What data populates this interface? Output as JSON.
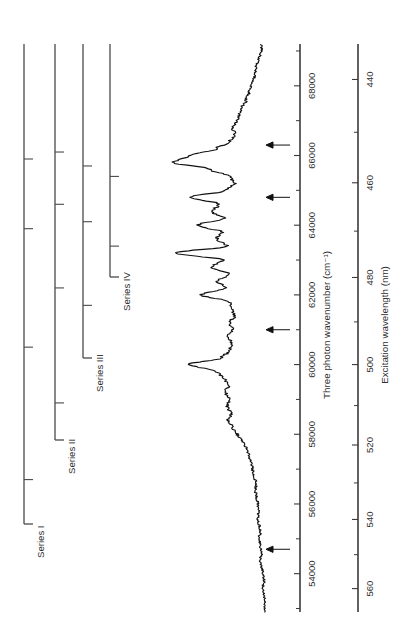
{
  "figure": {
    "orientation": "rotated-90-ccw",
    "background_color": "#ffffff",
    "trace_color": "#111111",
    "axis_color": "#3a3a3a",
    "series_bracket_color": "#4a4a4a"
  },
  "axes": {
    "wavenumber": {
      "label": "Three photon wavenumber (cm⁻¹)",
      "unit": "cm-1",
      "ticks": [
        54000,
        56000,
        58000,
        60000,
        62000,
        64000,
        66000,
        68000
      ],
      "tick_labels": [
        "54000",
        "56000",
        "58000",
        "60000",
        "62000",
        "64000",
        "66000",
        "68000"
      ],
      "minor_tick_step": 1000,
      "range": [
        52900,
        69200
      ]
    },
    "wavelength": {
      "label": "Excitation wavelength (nm)",
      "unit": "nm",
      "ticks": [
        440,
        460,
        480,
        500,
        520,
        540,
        560
      ],
      "tick_labels": [
        "440",
        "460",
        "480",
        "500",
        "520",
        "540",
        "560"
      ],
      "minor_tick_step": 10,
      "range": [
        434,
        567
      ]
    }
  },
  "series_brackets": [
    {
      "label": "Series I",
      "members": 4
    },
    {
      "label": "Series II",
      "members": 4
    },
    {
      "label": "Series III",
      "members": 3
    },
    {
      "label": "Series IV",
      "members": 2
    }
  ],
  "annotations": {
    "arrow_label": "peak-marker-arrow",
    "count": 4
  },
  "chart_data": {
    "type": "line",
    "title": "",
    "xlabel": "Three photon wavenumber (cm⁻¹)",
    "ylabel": "Ion signal (arb. units)",
    "secondary_xlabel": "Excitation wavelength (nm)",
    "xlim": [
      52900,
      69200
    ],
    "ylim": [
      0,
      1.05
    ],
    "grid": false,
    "legend": "none",
    "series": [
      {
        "name": "Three photon excitation spectrum",
        "x": [
          53000,
          53200,
          53400,
          53600,
          53800,
          54000,
          54200,
          54400,
          54600,
          54800,
          55000,
          55200,
          55400,
          55600,
          55800,
          56000,
          56200,
          56400,
          56600,
          56800,
          57000,
          57200,
          57400,
          57600,
          57800,
          58000,
          58200,
          58400,
          58600,
          58800,
          59000,
          59200,
          59400,
          59600,
          59800,
          60000,
          60200,
          60400,
          60600,
          60800,
          61000,
          61200,
          61400,
          61600,
          61800,
          62000,
          62200,
          62400,
          62600,
          62800,
          63000,
          63200,
          63400,
          63600,
          63800,
          64000,
          64200,
          64400,
          64600,
          64800,
          65000,
          65200,
          65400,
          65600,
          65800,
          66000,
          66200,
          66400,
          66600,
          66800,
          67000,
          67200,
          67400,
          67600,
          67800,
          68000,
          68200,
          68400,
          68600,
          68800,
          69000
        ],
        "y": [
          0.03,
          0.02,
          0.03,
          0.04,
          0.03,
          0.04,
          0.05,
          0.06,
          0.05,
          0.06,
          0.07,
          0.06,
          0.07,
          0.08,
          0.07,
          0.08,
          0.09,
          0.1,
          0.09,
          0.11,
          0.12,
          0.13,
          0.15,
          0.17,
          0.2,
          0.24,
          0.28,
          0.31,
          0.29,
          0.32,
          0.3,
          0.33,
          0.31,
          0.34,
          0.4,
          0.62,
          0.36,
          0.3,
          0.28,
          0.32,
          0.27,
          0.3,
          0.26,
          0.28,
          0.3,
          0.52,
          0.33,
          0.4,
          0.3,
          0.44,
          0.35,
          0.72,
          0.32,
          0.4,
          0.36,
          0.55,
          0.34,
          0.44,
          0.38,
          0.6,
          0.33,
          0.26,
          0.3,
          0.45,
          0.74,
          0.62,
          0.4,
          0.3,
          0.26,
          0.28,
          0.24,
          0.22,
          0.2,
          0.17,
          0.15,
          0.13,
          0.11,
          0.1,
          0.09,
          0.07,
          0.05
        ],
        "noise_amplitude": 0.015
      }
    ],
    "marked_peaks": [
      {
        "wavenumber": 54700,
        "wavelength": 548,
        "label": "arrow"
      },
      {
        "wavenumber": 61000,
        "wavelength": 492,
        "label": "arrow"
      },
      {
        "wavenumber": 64800,
        "wavelength": 463,
        "label": "arrow"
      },
      {
        "wavenumber": 66300,
        "wavelength": 452,
        "label": "arrow"
      }
    ],
    "series_members": {
      "Series I": [
        56700,
        60500,
        63900,
        65900
      ],
      "Series II": [
        58900,
        62200,
        64600,
        66100
      ],
      "Series III": [
        61700,
        64100,
        65700
      ],
      "Series IV": [
        63400,
        65400
      ]
    }
  }
}
